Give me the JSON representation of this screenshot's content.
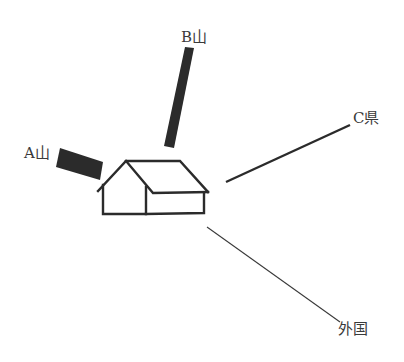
{
  "diagram": {
    "type": "house-with-directional-sources",
    "colors": {
      "background": "#ffffff",
      "stroke": "#2b2b2b",
      "block_fill": "#2b2b2b",
      "label": "#3a3a3a"
    },
    "elements": [
      {
        "id": "a",
        "label": "A山",
        "shape": "thick-block"
      },
      {
        "id": "b",
        "label": "B山",
        "shape": "thick-bar"
      },
      {
        "id": "c",
        "label": "C県",
        "shape": "medium-line"
      },
      {
        "id": "foreign",
        "label": "外国",
        "shape": "thin-line"
      }
    ],
    "center": {
      "label": "",
      "icon": "house-icon"
    }
  }
}
